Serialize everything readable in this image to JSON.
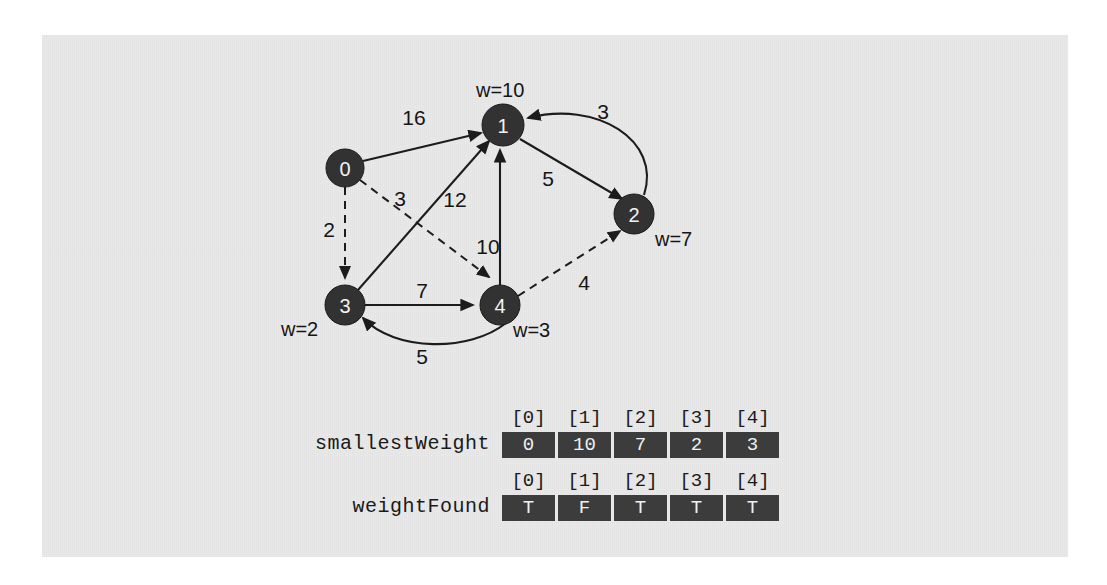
{
  "figure": {
    "type": "weighted-directed-graph-with-arrays",
    "background_color": "#e9e9e9",
    "node_color": "#323232",
    "cell_color": "#3c3c3c",
    "edge_color": "#1c1c1c"
  },
  "graph": {
    "nodes": [
      {
        "id": "0",
        "label": "0",
        "cx": 345,
        "cy": 168,
        "r": 19,
        "weight_label": "",
        "weight_x": 0,
        "weight_y": 0,
        "weight_anchor": "start"
      },
      {
        "id": "1",
        "label": "1",
        "cx": 503,
        "cy": 125,
        "r": 21,
        "weight_label": "w=10",
        "weight_x": 476,
        "weight_y": 90,
        "weight_anchor": "start"
      },
      {
        "id": "2",
        "label": "2",
        "cx": 634,
        "cy": 214,
        "r": 20,
        "weight_label": "w=7",
        "weight_x": 655,
        "weight_y": 239,
        "weight_anchor": "start"
      },
      {
        "id": "3",
        "label": "3",
        "cx": 345,
        "cy": 305,
        "r": 20,
        "weight_label": "w=2",
        "weight_x": 281,
        "weight_y": 329,
        "weight_anchor": "start"
      },
      {
        "id": "4",
        "label": "4",
        "cx": 500,
        "cy": 305,
        "r": 20,
        "weight_label": "w=3",
        "weight_x": 513,
        "weight_y": 330,
        "weight_anchor": "start"
      }
    ],
    "edges": [
      {
        "id": "e0-1",
        "from": "0",
        "to": "1",
        "weight": "16",
        "style": "solid",
        "label_x": 414,
        "label_y": 117,
        "path": "M 363 161 L 481 133"
      },
      {
        "id": "e0-3",
        "from": "0",
        "to": "3",
        "weight": "2",
        "style": "dashed",
        "label_x": 329,
        "label_y": 229,
        "path": "M 345 187 L 345 278"
      },
      {
        "id": "e0-4",
        "from": "0",
        "to": "4",
        "weight": "3",
        "style": "dashed",
        "label_x": 400,
        "label_y": 198,
        "path": "M 360 180 L 489 277"
      },
      {
        "id": "e3-1",
        "from": "3",
        "to": "1",
        "weight": "12",
        "style": "solid",
        "label_x": 455,
        "label_y": 199,
        "path": "M 358 290 L 489 141"
      },
      {
        "id": "e3-4",
        "from": "3",
        "to": "4",
        "weight": "7",
        "style": "solid",
        "label_x": 422,
        "label_y": 290,
        "path": "M 365 305 L 473 305"
      },
      {
        "id": "e4-1",
        "from": "4",
        "to": "1",
        "weight": "10",
        "style": "solid",
        "label_x": 488,
        "label_y": 246,
        "path": "M 500 285 L 500 150"
      },
      {
        "id": "e1-2",
        "from": "1",
        "to": "2",
        "weight": "5",
        "style": "solid",
        "label_x": 548,
        "label_y": 178,
        "path": "M 520 139 L 622 199"
      },
      {
        "id": "e2-1",
        "from": "2",
        "to": "1",
        "weight": "3",
        "style": "solid",
        "label_x": 603,
        "label_y": 111,
        "path": "M 644 195 C 662 140 596 100 528 118"
      },
      {
        "id": "e4-2",
        "from": "4",
        "to": "2",
        "weight": "4",
        "style": "dashed",
        "label_x": 584,
        "label_y": 282,
        "path": "M 518 296 L 620 231"
      },
      {
        "id": "e4-3",
        "from": "4",
        "to": "3",
        "weight": "5",
        "style": "solid",
        "label_x": 422,
        "label_y": 356,
        "path": "M 506 323 C 470 352 395 352 363 318"
      }
    ]
  },
  "arrays": [
    {
      "id": "smallestWeight",
      "name": "smallestWeight",
      "left": 240,
      "top": 409,
      "indices": [
        "[0]",
        "[1]",
        "[2]",
        "[3]",
        "[4]"
      ],
      "values": [
        "0",
        "10",
        "7",
        "2",
        "3"
      ]
    },
    {
      "id": "weightFound",
      "name": "weightFound",
      "left": 240,
      "top": 472,
      "indices": [
        "[0]",
        "[1]",
        "[2]",
        "[3]",
        "[4]"
      ],
      "values": [
        "T",
        "F",
        "T",
        "T",
        "T"
      ]
    }
  ]
}
